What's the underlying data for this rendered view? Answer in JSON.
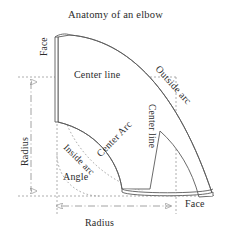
{
  "title": "Anatomy of an elbow",
  "colors": {
    "background": "#ffffff",
    "outline": "#5a5a5a",
    "construction_line": "#8c8c8c",
    "text": "#2b2b2b"
  },
  "labels": {
    "face_top": "Face",
    "face_bottom": "Face",
    "radius_vertical": "Radius",
    "radius_bottom": "Radius",
    "center_line_horizontal": "Center line",
    "center_line_vertical": "Center line",
    "center_arc": "Center Arc",
    "outside_arc": "Outside arc",
    "inside_arc": "Inside arc",
    "angle": "Angle"
  },
  "diagram": {
    "type": "technical-drawing",
    "parts": [
      "Face",
      "Center line",
      "Center Arc",
      "Outside arc",
      "Inside arc",
      "Angle",
      "Radius"
    ],
    "sweep_degrees": 90,
    "geometry": {
      "center_x": 57,
      "center_y": 196,
      "inner_radius": 65,
      "center_radius": 119,
      "outer_radius": 156,
      "angle_arc_radius": 42,
      "face_top_y": 36,
      "face_bottom_y": 196
    },
    "dimensions": [
      {
        "name": "Radius",
        "orientation": "vertical",
        "from_y": 77,
        "to_y": 196,
        "at_x": 31
      },
      {
        "name": "Radius",
        "orientation": "horizontal",
        "from_x": 57,
        "to_x": 176,
        "at_y": 206
      }
    ]
  }
}
